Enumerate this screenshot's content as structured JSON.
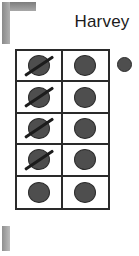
{
  "title": "Harvey",
  "decorations": {
    "corner_bracket": "corner-bracket-mark",
    "bottom_bar": "bottom-bar-mark"
  },
  "grid": {
    "rows": 5,
    "columns": 2,
    "cells": [
      [
        {
          "token": "circle",
          "crossed_out": true
        },
        {
          "token": "circle",
          "crossed_out": false
        }
      ],
      [
        {
          "token": "circle",
          "crossed_out": true
        },
        {
          "token": "circle",
          "crossed_out": false
        }
      ],
      [
        {
          "token": "circle",
          "crossed_out": true
        },
        {
          "token": "circle",
          "crossed_out": false
        }
      ],
      [
        {
          "token": "circle",
          "crossed_out": true
        },
        {
          "token": "circle",
          "crossed_out": false
        }
      ],
      [
        {
          "token": "circle",
          "crossed_out": false
        },
        {
          "token": "circle",
          "crossed_out": false
        }
      ]
    ]
  },
  "loose_token": {
    "token": "circle",
    "crossed_out": false
  },
  "colors": {
    "background": "#ffffff",
    "grid_line": "#2a2a2a",
    "token_fill": "#4e4e4e",
    "token_stroke": "#2b2b2b",
    "slash": "#1c1c1c",
    "title_text": "#1b1b1b",
    "decoration_gray": "#9a9a9a"
  }
}
